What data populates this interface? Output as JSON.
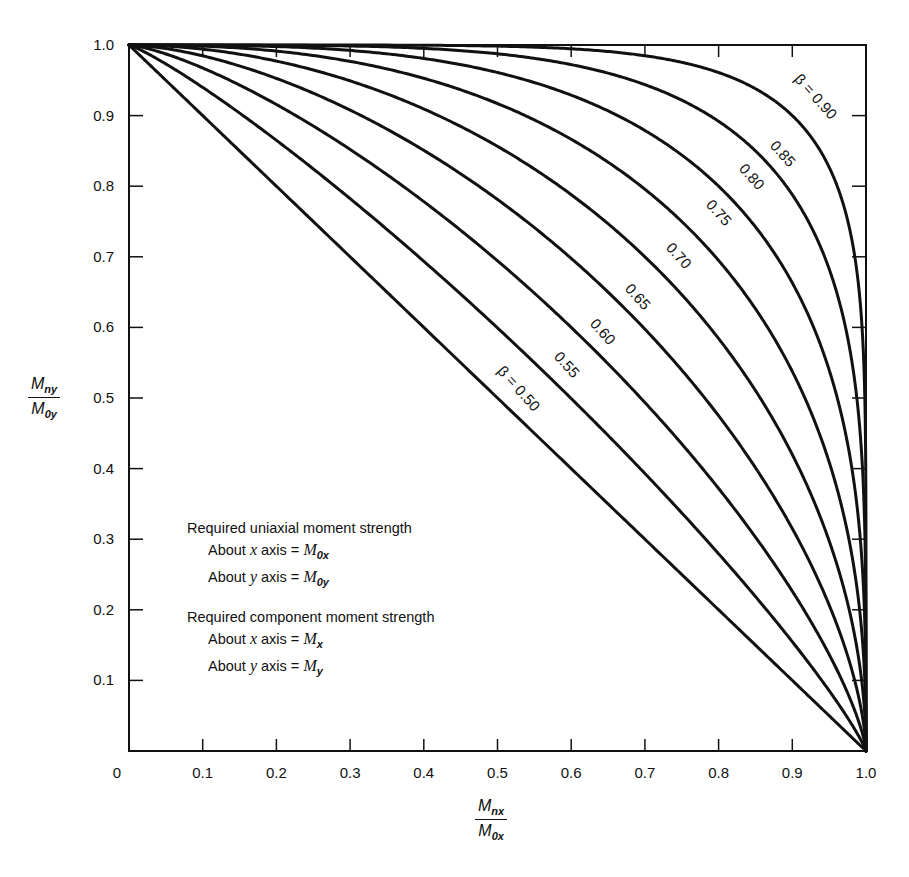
{
  "chart_data": {
    "type": "line",
    "title": "",
    "xlabel": "Mnx / M0x",
    "ylabel": "Mny / M0y",
    "xlim": [
      0,
      1.0
    ],
    "ylim": [
      0,
      1.0
    ],
    "grid": false,
    "x_ticks": [
      "0",
      "0.1",
      "0.2",
      "0.3",
      "0.4",
      "0.5",
      "0.6",
      "0.7",
      "0.8",
      "0.9",
      "1.0"
    ],
    "y_ticks": [
      "0.1",
      "0.2",
      "0.3",
      "0.4",
      "0.5",
      "0.6",
      "0.7",
      "0.8",
      "0.9",
      "1.0"
    ],
    "relation": "(Mnx/M0x)^a + (Mny/M0y)^a = 1, a = log(0.5)/log(beta)",
    "series": [
      {
        "name": "β = 0.50",
        "beta": 0.5,
        "label": "β = 0.50",
        "label_pos": [
          515,
          392
        ]
      },
      {
        "name": "0.55",
        "beta": 0.55,
        "label": "0.55",
        "label_pos": [
          563,
          368
        ]
      },
      {
        "name": "0.60",
        "beta": 0.6,
        "label": "0.60",
        "label_pos": [
          599,
          335
        ]
      },
      {
        "name": "0.65",
        "beta": 0.65,
        "label": "0.65",
        "label_pos": [
          634,
          300
        ]
      },
      {
        "name": "0.70",
        "beta": 0.7,
        "label": "0.70",
        "label_pos": [
          675,
          259
        ]
      },
      {
        "name": "0.75",
        "beta": 0.75,
        "label": "0.75",
        "label_pos": [
          715,
          216
        ]
      },
      {
        "name": "0.80",
        "beta": 0.8,
        "label": "0.80",
        "label_pos": [
          748,
          180
        ]
      },
      {
        "name": "0.85",
        "beta": 0.85,
        "label": "0.85",
        "label_pos": [
          779,
          157
        ]
      },
      {
        "name": "β = 0.90",
        "beta": 0.9,
        "label": "β = 0.90",
        "label_pos": [
          812,
          100
        ]
      }
    ],
    "sample_points": {
      "β=0.50": [
        [
          0,
          1
        ],
        [
          0.5,
          0.5
        ],
        [
          1,
          0
        ]
      ],
      "β=0.60": [
        [
          0,
          1
        ],
        [
          0.6,
          0.6
        ],
        [
          1,
          0
        ]
      ],
      "β=0.70": [
        [
          0,
          1
        ],
        [
          0.7,
          0.7
        ],
        [
          1,
          0
        ]
      ],
      "β=0.80": [
        [
          0,
          1
        ],
        [
          0.8,
          0.8
        ],
        [
          1,
          0
        ]
      ],
      "β=0.90": [
        [
          0,
          1
        ],
        [
          0.9,
          0.9
        ],
        [
          1,
          0
        ]
      ]
    }
  },
  "axis": {
    "x_num": "M",
    "x_num_sub": "nx",
    "x_den": "M",
    "x_den_sub": "0x",
    "y_num": "M",
    "y_num_sub": "ny",
    "y_den": "M",
    "y_den_sub": "0y"
  },
  "legend": {
    "heading1": "Required uniaxial moment strength",
    "row1_prefix": "About ",
    "row1_var": "x",
    "row1_mid": " axis = ",
    "row1_sym": "M",
    "row1_sub": "0x",
    "row2_prefix": "About ",
    "row2_var": "y",
    "row2_mid": " axis = ",
    "row2_sym": "M",
    "row2_sub": "0y",
    "heading2": "Required component moment strength",
    "row3_prefix": "About ",
    "row3_var": "x",
    "row3_mid": " axis = ",
    "row3_sym": "M",
    "row3_sub": "x",
    "row4_prefix": "About ",
    "row4_var": "y",
    "row4_mid": " axis = ",
    "row4_sym": "M",
    "row4_sub": "y"
  },
  "style": {
    "line_color": "#111111",
    "background": "#ffffff"
  }
}
